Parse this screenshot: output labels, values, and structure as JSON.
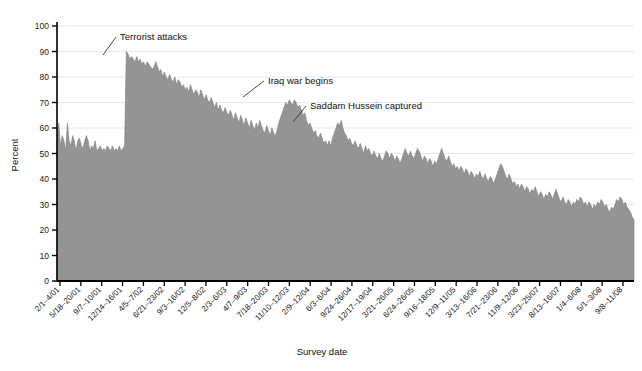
{
  "chart_data": {
    "type": "area",
    "title": "",
    "xlabel": "Survey date",
    "ylabel": "Percent",
    "ylim": [
      0,
      100
    ],
    "ytick_step": 10,
    "yticks": [
      0,
      10,
      20,
      30,
      40,
      50,
      60,
      70,
      80,
      90,
      100
    ],
    "grid": true,
    "legend": "none",
    "fill_color": "#949494",
    "line_color": "#808080",
    "axis_color": "#000000",
    "grid_color": "#e8e8e8",
    "xtick_labels": [
      "2/1–4/01",
      "5/18–20/01",
      "9/7–10/01",
      "12/14–16/01",
      "4/5–7/02",
      "6/21–23/02",
      "9/3–16/02",
      "12/5–8/02",
      "2/3–6/03",
      "4/7–9/03",
      "7/18–20/03",
      "11/10–12/03",
      "2/9–12/04",
      "6/3–6/04",
      "9/24–26/04",
      "12/17–19/04",
      "3/21–26/05",
      "6/24–26/05",
      "9/16–18/05",
      "12/9–11/05",
      "3/13–16/06",
      "7/21–23/06",
      "11/9–12/06",
      "3/23–25/07",
      "8/13–16/07",
      "1/4–6/08",
      "5/1–3/08",
      "9/8–11/08"
    ],
    "annotations": [
      {
        "text": "Terrorist attacks",
        "label_x": 120,
        "label_y": 36,
        "point_x": 103,
        "point_y": 55
      },
      {
        "text": "Iraq war begins",
        "label_x": 268,
        "label_y": 80,
        "point_x": 243,
        "point_y": 97
      },
      {
        "text": "Saddam Hussein captured",
        "label_x": 310,
        "label_y": 105,
        "point_x": 293,
        "point_y": 122
      }
    ],
    "values": [
      57,
      62,
      53,
      57,
      55,
      51,
      62,
      55,
      53,
      57,
      55,
      51,
      55,
      56,
      53,
      52,
      55,
      57,
      55,
      51,
      53,
      52,
      55,
      51,
      52,
      53,
      51,
      52,
      51,
      53,
      52,
      51,
      53,
      51,
      52,
      51,
      53,
      51,
      52,
      53,
      90,
      89,
      87,
      88,
      87,
      86,
      88,
      86,
      87,
      85,
      86,
      84,
      86,
      85,
      84,
      83,
      84,
      86,
      84,
      82,
      83,
      80,
      82,
      80,
      79,
      81,
      79,
      78,
      80,
      77,
      79,
      78,
      76,
      77,
      75,
      76,
      74,
      77,
      75,
      73,
      75,
      74,
      72,
      75,
      73,
      71,
      73,
      71,
      70,
      72,
      70,
      68,
      70,
      67,
      69,
      67,
      66,
      68,
      66,
      65,
      67,
      65,
      63,
      66,
      64,
      62,
      65,
      63,
      61,
      64,
      62,
      60,
      63,
      61,
      59,
      62,
      60,
      63,
      61,
      59,
      58,
      61,
      59,
      57,
      60,
      58,
      57,
      59,
      62,
      64,
      66,
      68,
      70,
      69,
      71,
      70,
      69,
      71,
      70,
      68,
      69,
      67,
      65,
      66,
      63,
      61,
      62,
      60,
      58,
      59,
      57,
      56,
      58,
      56,
      54,
      55,
      53,
      55,
      53,
      56,
      58,
      60,
      62,
      61,
      63,
      60,
      58,
      57,
      55,
      56,
      54,
      53,
      55,
      53,
      52,
      54,
      52,
      50,
      53,
      51,
      52,
      50,
      49,
      51,
      49,
      48,
      50,
      48,
      47,
      49,
      51,
      50,
      48,
      50,
      49,
      47,
      49,
      48,
      46,
      48,
      50,
      52,
      50,
      49,
      51,
      49,
      48,
      50,
      52,
      51,
      49,
      47,
      49,
      48,
      46,
      48,
      47,
      45,
      47,
      46,
      48,
      50,
      52,
      50,
      48,
      47,
      49,
      47,
      45,
      46,
      44,
      45,
      43,
      45,
      44,
      42,
      44,
      43,
      41,
      43,
      42,
      40,
      42,
      41,
      43,
      41,
      40,
      42,
      40,
      39,
      41,
      40,
      38,
      40,
      42,
      44,
      46,
      45,
      43,
      41,
      40,
      42,
      40,
      38,
      39,
      37,
      38,
      36,
      38,
      37,
      35,
      37,
      36,
      34,
      36,
      35,
      37,
      35,
      33,
      35,
      34,
      32,
      34,
      33,
      35,
      34,
      32,
      34,
      36,
      34,
      32,
      31,
      33,
      31,
      30,
      32,
      31,
      29,
      31,
      30,
      32,
      31,
      33,
      32,
      30,
      31,
      29,
      31,
      30,
      28,
      30,
      29,
      31,
      30,
      32,
      31,
      29,
      30,
      28,
      27,
      29,
      28,
      30,
      32,
      31,
      33,
      32,
      30,
      31,
      29,
      28,
      27,
      25,
      24
    ]
  }
}
